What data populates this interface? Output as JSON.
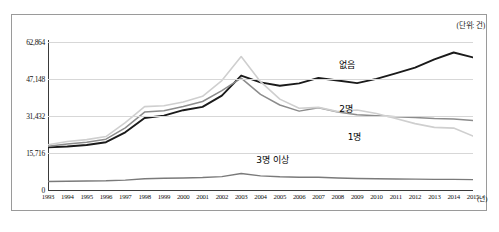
{
  "unit_note": "(단위: 건)",
  "x_unit": "(년)",
  "caption": "",
  "chart_data": {
    "type": "line",
    "title": "",
    "subtitle": "",
    "xlabel": "(년)",
    "ylabel": "(단위: 건)",
    "grid": true,
    "legend_position": "inline-annotations",
    "ylim": [
      0,
      62864
    ],
    "yticks": [
      0,
      15716,
      31432,
      47148,
      62864
    ],
    "ytick_labels": [
      "0",
      "15,716",
      "31,432",
      "47,148",
      "62,864"
    ],
    "categories": [
      "1993",
      "1994",
      "1995",
      "1996",
      "1997",
      "1998",
      "1999",
      "2000",
      "2001",
      "2002",
      "2003",
      "2004",
      "2005",
      "2006",
      "2007",
      "2008",
      "2009",
      "2010",
      "2011",
      "2012",
      "2013",
      "2014",
      "2015"
    ],
    "series": [
      {
        "name": "없음",
        "color": "#1a1a1a",
        "width": 1.9,
        "values": [
          18100,
          18500,
          19100,
          20300,
          24500,
          30600,
          31600,
          33900,
          35300,
          40100,
          48600,
          45700,
          44300,
          45300,
          47600,
          46500,
          45400,
          47200,
          49500,
          52000,
          55500,
          58400,
          56300
        ]
      },
      {
        "name": "2명",
        "color": "#8c8c8c",
        "width": 1.5,
        "values": [
          18600,
          19500,
          20300,
          21600,
          26400,
          33100,
          33700,
          35500,
          37600,
          42200,
          47500,
          40600,
          36100,
          33500,
          34900,
          33100,
          32000,
          31500,
          31100,
          30800,
          30400,
          30200,
          29500
        ]
      },
      {
        "name": "1명",
        "color": "#cfcfcf",
        "width": 1.6,
        "values": [
          19200,
          20600,
          21400,
          22700,
          28600,
          35400,
          35800,
          37400,
          39800,
          46500,
          56700,
          46000,
          38600,
          34700,
          35100,
          33300,
          34000,
          32500,
          30400,
          28200,
          26600,
          26300,
          22900
        ]
      },
      {
        "name": "3명 이상",
        "color": "#7a7a7a",
        "width": 1.4,
        "values": [
          3600,
          3700,
          3800,
          3900,
          4200,
          4800,
          5000,
          5100,
          5300,
          5700,
          7000,
          6000,
          5600,
          5400,
          5400,
          5100,
          4900,
          4800,
          4700,
          4600,
          4500,
          4500,
          4400
        ]
      }
    ],
    "annotations": [
      {
        "text": "없음",
        "x_pct": 68.5,
        "y_pct": 11.0
      },
      {
        "text": "2명",
        "x_pct": 68.5,
        "y_pct": 40.5
      },
      {
        "text": "1명",
        "x_pct": 70.5,
        "y_pct": 59.5
      },
      {
        "text": "3명 이상",
        "x_pct": 49.0,
        "y_pct": 75.0
      }
    ]
  }
}
